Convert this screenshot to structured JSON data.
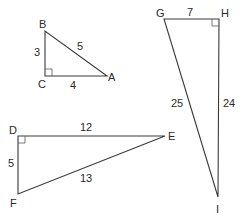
{
  "diagram": {
    "type": "right-triangles",
    "triangles": [
      {
        "id": "ABC",
        "vertices": {
          "A": [
            107,
            76
          ],
          "B": [
            45,
            31
          ],
          "C": [
            45,
            76
          ]
        },
        "right_angle_at": "C",
        "sides": {
          "BC": "3",
          "CA": "4",
          "AB": "5"
        }
      },
      {
        "id": "GHI",
        "vertices": {
          "G": [
            164,
            19
          ],
          "H": [
            219,
            19
          ],
          "I": [
            218,
            197
          ]
        },
        "right_angle_at": "H",
        "sides": {
          "GH": "7",
          "HI": "24",
          "GI": "25"
        }
      },
      {
        "id": "DEF",
        "vertices": {
          "D": [
            18,
            136
          ],
          "E": [
            165,
            136
          ],
          "F": [
            18,
            194
          ]
        },
        "right_angle_at": "D",
        "sides": {
          "DE": "12",
          "DF": "5",
          "EF": "13"
        }
      }
    ]
  },
  "labels": {
    "A": "A",
    "B": "B",
    "C": "C",
    "D": "D",
    "E": "E",
    "F": "F",
    "G": "G",
    "H": "H",
    "I": "I",
    "BC": "3",
    "CA": "4",
    "AB": "5",
    "GH": "7",
    "HI": "24",
    "GI": "25",
    "DE": "12",
    "DF": "5",
    "EF": "13"
  }
}
